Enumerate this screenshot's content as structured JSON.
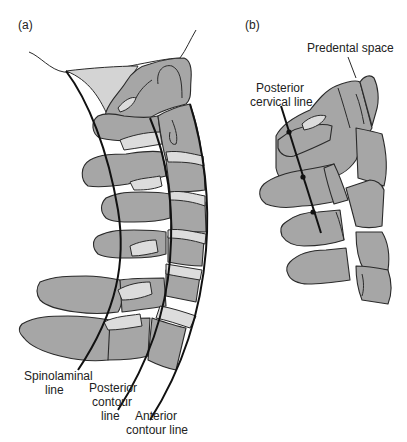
{
  "figure": {
    "panels": [
      {
        "id": "a",
        "label": "(a)",
        "annotations": {
          "spinolaminal_1": "Spinolaminal",
          "spinolaminal_2": "line",
          "posterior_1": "Posterior",
          "posterior_2": "contour",
          "posterior_3": "line",
          "anterior_1": "Anterior",
          "anterior_2": "contour line"
        }
      },
      {
        "id": "b",
        "label": "(b)",
        "annotations": {
          "predental": "Predental space",
          "pcl_1": "Posterior",
          "pcl_2": "cervical line"
        }
      }
    ],
    "colors": {
      "bone": "#a6a6a6",
      "disc": "#dcdcdc",
      "outline": "#2a2a2a",
      "background": "#ffffff"
    }
  }
}
